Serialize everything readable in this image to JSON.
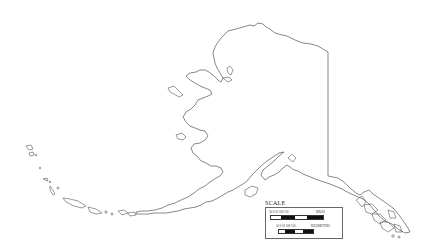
{
  "map": {
    "title": "Alaska outline map",
    "region": "Alaska",
    "stroke_color": "#555555",
    "background": "#ffffff"
  },
  "legend": {
    "title": "SCALE",
    "miles": {
      "ticks": "50  0  50  100  150",
      "unit": "MILES"
    },
    "kilometers": {
      "ticks": "50  0  50 100  150",
      "unit": "KILOMETERS"
    }
  }
}
